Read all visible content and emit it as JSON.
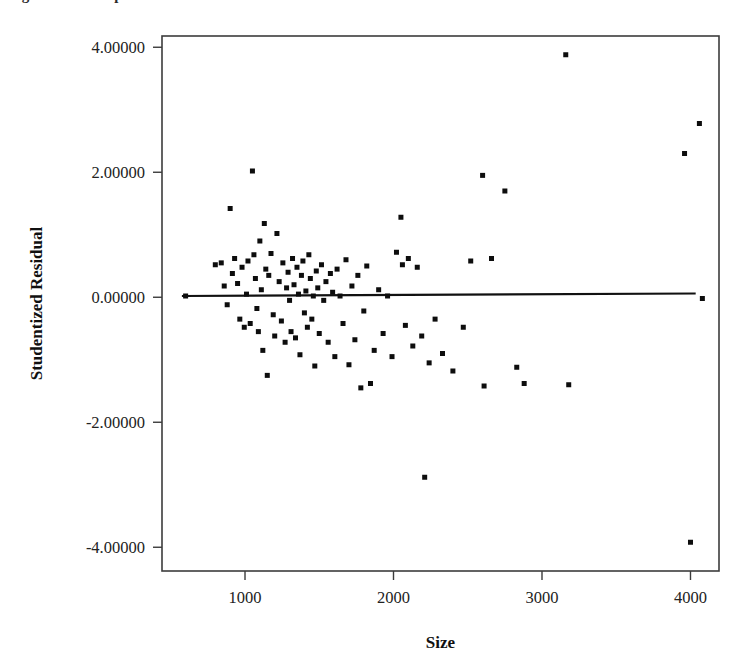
{
  "figure": {
    "clipped_caption_text": "Figure 1 Scatterplot of Studentized Residual vs Size"
  },
  "chart_data": {
    "type": "scatter",
    "title": "",
    "xlabel": "Size",
    "ylabel": "Studentized Residual",
    "xlim": [
      441,
      4192
    ],
    "ylim": [
      -4.38,
      4.18
    ],
    "xticks": [
      1000,
      2000,
      3000,
      4000
    ],
    "xtick_labels": [
      "1000",
      "2000",
      "3000",
      "4000"
    ],
    "yticks": [
      4,
      2,
      0,
      -2,
      -4
    ],
    "ytick_labels": [
      "4.00000",
      "2.00000",
      "0.00000",
      "-2.00000",
      "-4.00000"
    ],
    "grid": false,
    "legend": null,
    "marker": "square",
    "marker_color": "#0d0d0d",
    "marker_size_px": 5,
    "reference_line": {
      "label": "zero residual reference line",
      "color": "#111111",
      "x_start": 575,
      "x_end": 4035,
      "y_start": 0.02,
      "y_end": 0.06
    },
    "x": [
      600,
      800,
      840,
      860,
      880,
      900,
      915,
      930,
      950,
      965,
      980,
      995,
      1010,
      1020,
      1035,
      1050,
      1060,
      1070,
      1080,
      1090,
      1100,
      1110,
      1120,
      1130,
      1140,
      1150,
      1160,
      1175,
      1190,
      1200,
      1215,
      1230,
      1245,
      1255,
      1270,
      1280,
      1290,
      1300,
      1310,
      1320,
      1330,
      1340,
      1350,
      1360,
      1370,
      1380,
      1390,
      1400,
      1410,
      1420,
      1430,
      1440,
      1450,
      1460,
      1470,
      1480,
      1490,
      1500,
      1515,
      1530,
      1545,
      1560,
      1575,
      1590,
      1605,
      1620,
      1640,
      1660,
      1680,
      1700,
      1720,
      1740,
      1760,
      1780,
      1800,
      1820,
      1845,
      1870,
      1900,
      1930,
      1960,
      1990,
      2020,
      2050,
      2060,
      2080,
      2100,
      2130,
      2160,
      2190,
      2210,
      2240,
      2280,
      2330,
      2400,
      2470,
      2520,
      2600,
      2610,
      2660,
      2750,
      2830,
      2880,
      3160,
      3180,
      3960,
      4000,
      4060,
      4080
    ],
    "y": [
      0.02,
      0.52,
      0.55,
      0.18,
      -0.12,
      1.42,
      0.38,
      0.62,
      0.22,
      -0.35,
      0.48,
      -0.48,
      0.05,
      0.58,
      -0.42,
      2.02,
      0.68,
      0.3,
      -0.18,
      -0.55,
      0.9,
      0.12,
      -0.85,
      1.18,
      0.45,
      -1.25,
      0.35,
      0.7,
      -0.28,
      -0.62,
      1.02,
      0.25,
      -0.38,
      0.55,
      -0.72,
      0.15,
      0.4,
      -0.05,
      -0.55,
      0.62,
      0.2,
      -0.65,
      0.48,
      0.05,
      -0.92,
      0.35,
      0.58,
      -0.25,
      0.1,
      -0.48,
      0.68,
      0.3,
      -0.35,
      0.02,
      -1.1,
      0.42,
      0.15,
      -0.58,
      0.52,
      -0.05,
      0.25,
      -0.72,
      0.38,
      0.08,
      -0.95,
      0.45,
      0.02,
      -0.42,
      0.6,
      -1.08,
      0.18,
      -0.68,
      0.35,
      -1.45,
      -0.22,
      0.5,
      -1.38,
      -0.85,
      0.12,
      -0.58,
      0.02,
      -0.95,
      0.72,
      1.28,
      0.52,
      -0.45,
      0.62,
      -0.78,
      0.48,
      -0.62,
      -2.88,
      -1.05,
      -0.35,
      -0.9,
      -1.18,
      -0.48,
      0.58,
      1.95,
      -1.42,
      0.62,
      1.7,
      -1.12,
      -1.38,
      3.88,
      -1.4,
      2.3,
      -3.92,
      2.78,
      -0.02
    ]
  }
}
